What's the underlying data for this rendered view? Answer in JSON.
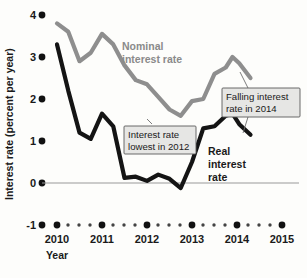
{
  "chart_data": {
    "type": "line",
    "title": "",
    "xlabel": "Year",
    "ylabel": "Interest rate (percent per year)",
    "xlim": [
      2010,
      2015
    ],
    "ylim": [
      -1,
      4
    ],
    "grid": false,
    "legend_position": "inline-labels",
    "y_ticks": [
      "4",
      "3",
      "2",
      "1",
      "0",
      "-1"
    ],
    "y_tick_values": [
      4,
      3,
      2,
      1,
      0,
      -1
    ],
    "x_ticks": [
      "2010",
      "2011",
      "2012",
      "2013",
      "2014",
      "2015"
    ],
    "x_tick_values": [
      2010,
      2011,
      2012,
      2013,
      2014,
      2015
    ],
    "zero_reference_line": 0,
    "series": [
      {
        "name": "Nominal interest rate",
        "color": "#8e8e8e",
        "x": [
          2010.0,
          2010.25,
          2010.5,
          2010.75,
          2011.0,
          2011.25,
          2011.5,
          2011.75,
          2012.0,
          2012.25,
          2012.5,
          2012.75,
          2013.0,
          2013.25,
          2013.5,
          2013.75,
          2013.9,
          2014.05,
          2014.3
        ],
        "values": [
          3.8,
          3.6,
          2.9,
          3.1,
          3.55,
          3.3,
          2.8,
          2.45,
          2.35,
          2.05,
          1.75,
          1.6,
          1.95,
          2.0,
          2.6,
          2.75,
          3.0,
          2.85,
          2.5
        ]
      },
      {
        "name": "Real interest rate",
        "color": "#141414",
        "x": [
          2010.0,
          2010.25,
          2010.5,
          2010.75,
          2011.0,
          2011.25,
          2011.5,
          2011.75,
          2012.0,
          2012.25,
          2012.5,
          2012.75,
          2013.0,
          2013.25,
          2013.5,
          2013.75,
          2013.9,
          2014.05,
          2014.3
        ],
        "values": [
          3.3,
          2.2,
          1.2,
          1.05,
          1.65,
          1.35,
          0.12,
          0.15,
          0.05,
          0.2,
          0.1,
          -0.12,
          0.5,
          1.3,
          1.35,
          1.6,
          1.65,
          1.4,
          1.15
        ]
      }
    ],
    "annotations": [
      {
        "id": "callout-lowest-2012",
        "lines": [
          "Interest rate",
          "lowest in 2012"
        ],
        "target_series": "Nominal interest rate",
        "target_x": 2012.75,
        "target_y": 1.6
      },
      {
        "id": "callout-falling-2014",
        "lines": [
          "Falling interest",
          "rate in 2014"
        ],
        "target_series": "Nominal interest rate",
        "target_x": 2014.1,
        "target_y": 2.75
      }
    ],
    "series_inline_labels": [
      {
        "id": "label-nominal",
        "lines": [
          "Nominal",
          "interest rate"
        ],
        "series": "Nominal interest rate"
      },
      {
        "id": "label-real",
        "lines": [
          "Real",
          "interest",
          "rate"
        ],
        "series": "Real interest rate"
      }
    ]
  },
  "axes": {
    "y_label": "Interest rate (percent per year)",
    "x_label": "Year"
  },
  "colors": {
    "nominal": "#8e8e8e",
    "real": "#141414",
    "callout_fill": "#e6e6e4",
    "callout_border": "#5a5a5a",
    "zero_line": "#9a9a9a"
  }
}
